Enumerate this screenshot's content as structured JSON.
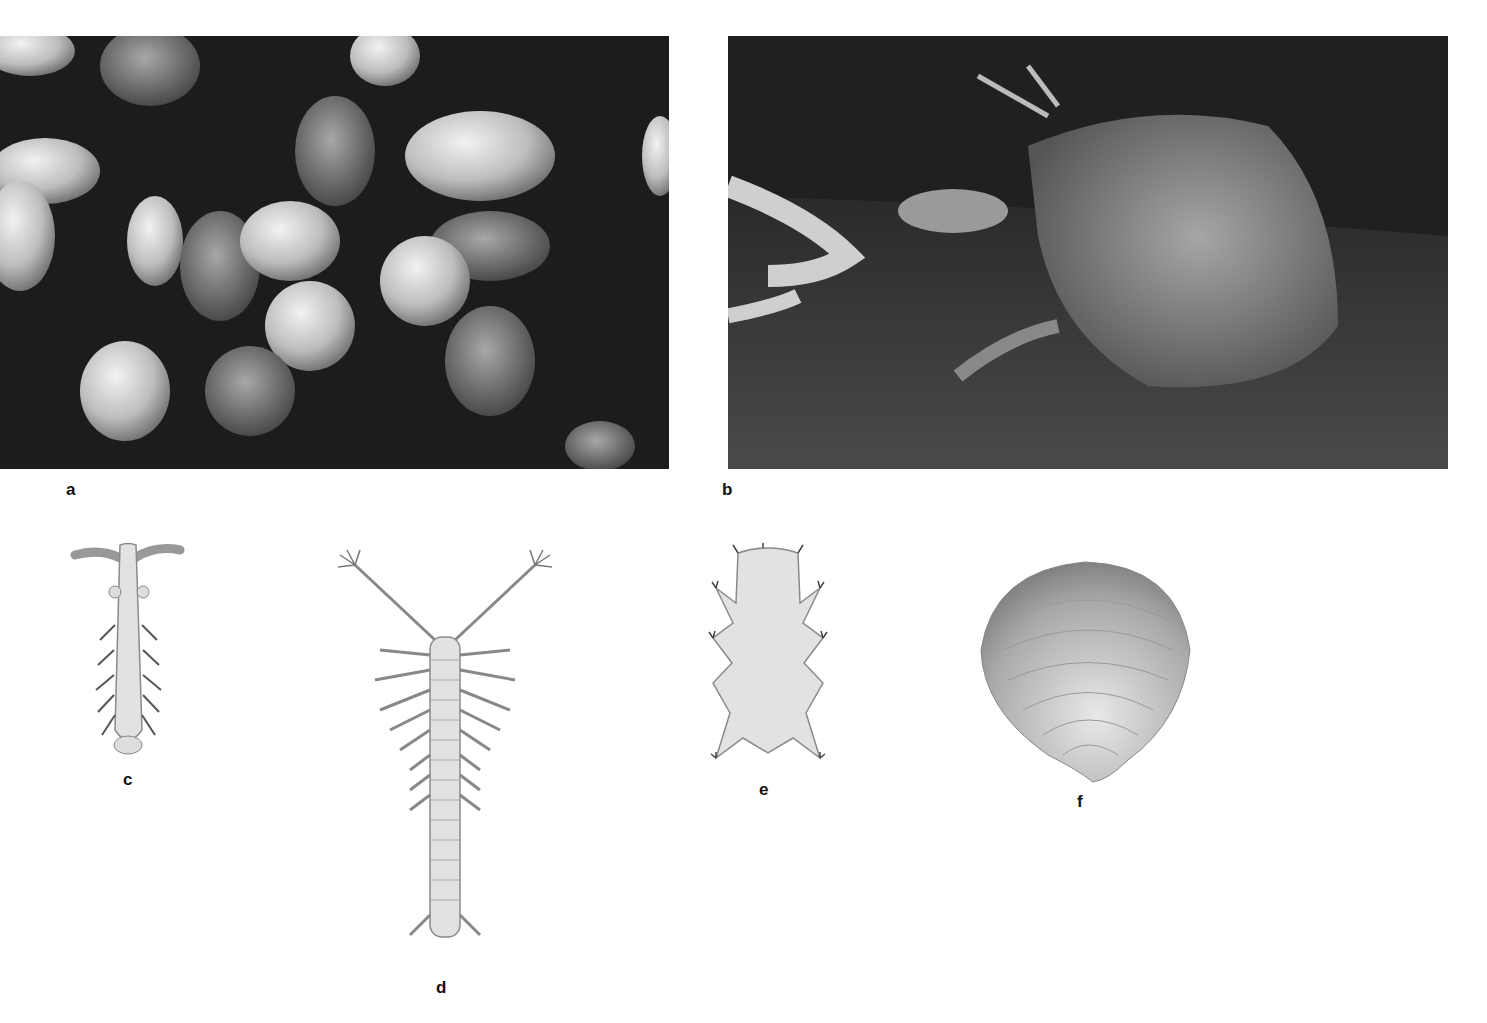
{
  "figure": {
    "panels": [
      {
        "id": "a",
        "label": "a",
        "kind": "photograph",
        "subject": "clam shells on sand"
      },
      {
        "id": "b",
        "label": "b",
        "kind": "photograph",
        "subject": "mole crab burrowing in sand"
      },
      {
        "id": "c",
        "label": "c",
        "kind": "illustration",
        "subject": "segmented worm-like animal with antennae"
      },
      {
        "id": "d",
        "label": "d",
        "kind": "illustration",
        "subject": "long segmented animal with branched antennae"
      },
      {
        "id": "e",
        "label": "e",
        "kind": "illustration",
        "subject": "tardigrade"
      },
      {
        "id": "f",
        "label": "f",
        "kind": "illustration",
        "subject": "rounded bivalve shell"
      }
    ]
  },
  "colors": {
    "background": "#ffffff",
    "photo_dark": "#161616",
    "illustration_fill": "#e4e4e4",
    "illustration_stroke": "#8a8a8a"
  }
}
